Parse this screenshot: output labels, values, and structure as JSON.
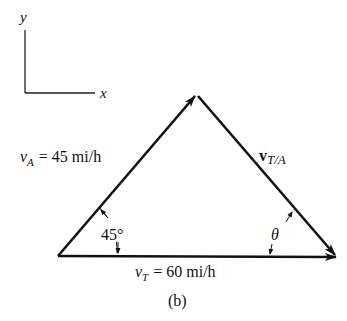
{
  "axes": {
    "x_label": "x",
    "y_label": "y"
  },
  "vectors": {
    "vA": {
      "symbol": "v",
      "subscript": "A",
      "eq": "= 45 mi/h"
    },
    "vT": {
      "symbol": "v",
      "subscript": "T",
      "eq": "= 60 mi/h"
    },
    "vTA": {
      "symbol": "v",
      "subscript": "T/A"
    }
  },
  "angles": {
    "alpha": "45°",
    "theta": "θ"
  },
  "caption": "(b)",
  "colors": {
    "stroke": "#111111",
    "background": "#ffffff"
  }
}
